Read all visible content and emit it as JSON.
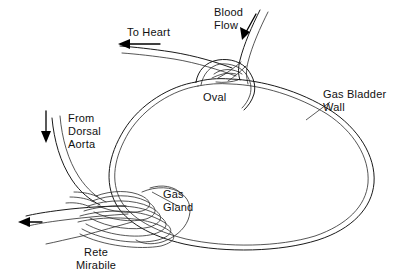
{
  "diagram": {
    "background_color": "#ffffff",
    "ink_color": "#1a1a1a",
    "width": 400,
    "height": 275,
    "labels": {
      "to_heart": "To Heart",
      "blood_flow_line1": "Blood",
      "blood_flow_line2": "Flow",
      "oval": "Oval",
      "gas_bladder_wall_line1": "Gas Bladder",
      "gas_bladder_wall_line2": "Wall",
      "from_dorsal_aorta_line1": "From",
      "from_dorsal_aorta_line2": "Dorsal",
      "from_dorsal_aorta_line3": "Aorta",
      "gas_gland_line1": "Gas",
      "gas_gland_line2": "Gland",
      "rete_mirabile_line1": "Rete",
      "rete_mirabile_line2": "Mirabile"
    },
    "arrows": [
      {
        "name": "to-heart-arrow",
        "direction": "left",
        "label": "To Heart"
      },
      {
        "name": "blood-flow-arrow",
        "direction": "down-left",
        "label": "Blood Flow"
      },
      {
        "name": "from-dorsal-aorta-arrow",
        "direction": "down",
        "label": "From Dorsal Aorta"
      },
      {
        "name": "rete-outflow-arrow",
        "direction": "left",
        "label": ""
      }
    ],
    "structures": [
      {
        "name": "gas-bladder-wall",
        "style": "double-line-outline"
      },
      {
        "name": "oval",
        "style": "narrow-neck-aperture"
      },
      {
        "name": "gas-gland",
        "style": "lobed-mass"
      },
      {
        "name": "rete-mirabile",
        "style": "nested-capillary-loops",
        "loop_count": 6
      }
    ]
  }
}
